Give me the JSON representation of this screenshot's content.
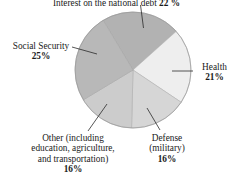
{
  "chart_data": {
    "type": "pie",
    "title": "",
    "categories": [
      "Interest on the national debt",
      "Health",
      "Defense (military)",
      "Other (including education, agriculture, and transportation)",
      "Social Security"
    ],
    "values": [
      22,
      21,
      16,
      16,
      25
    ],
    "value_suffix": "%",
    "legend": "none",
    "labels_position": "outside-with-leader-lines",
    "grid": false,
    "slice_colors": [
      "#b2b2b2",
      "#eeeeee",
      "#d6d6d6",
      "#cccccc",
      "#b8b8b8"
    ],
    "outline_color": "#9a9a9a",
    "slices": [
      {
        "name": "interest-on-the-national-debt",
        "label": "Interest on the national debt",
        "value": 22,
        "value_text": "22",
        "percent_text": "22 %",
        "color": "#b2b2b2",
        "start_angle_deg": -31,
        "end_angle_deg": 48
      },
      {
        "name": "health",
        "label": "Health",
        "value": 21,
        "value_text": "21",
        "percent_text": "21%",
        "color": "#eeeeee",
        "start_angle_deg": 48,
        "end_angle_deg": 124
      },
      {
        "name": "defense-military",
        "label_line_1": "Defense",
        "label_line_2": "(military)",
        "label": "Defense (military)",
        "value": 16,
        "value_text": "16",
        "percent_text": "16%",
        "color": "#d6d6d6",
        "start_angle_deg": 124,
        "end_angle_deg": 182
      },
      {
        "name": "other",
        "label_line_1": "Other (including",
        "label_line_2": "education, agriculture,",
        "label_line_3": "and transportation)",
        "label": "Other (including education, agriculture, and transportation)",
        "value": 16,
        "value_text": "16",
        "percent_text": "16%",
        "color": "#cccccc",
        "start_angle_deg": 182,
        "end_angle_deg": 240
      },
      {
        "name": "social-security",
        "label": "Social Security",
        "value": 25,
        "value_text": "25",
        "percent_text": "25%",
        "color": "#b8b8b8",
        "start_angle_deg": 240,
        "end_angle_deg": 329
      }
    ]
  },
  "labels": {
    "interest": {
      "text": "Interest on the national debt",
      "percent": "22 %"
    },
    "social_security": {
      "text": "Social Security",
      "percent": "25%"
    },
    "health": {
      "text": "Health",
      "percent": "21%"
    },
    "defense": {
      "line1": "Defense",
      "line2": "(military)",
      "percent": "16%"
    },
    "other": {
      "line1": "Other (including",
      "line2": "education, agriculture,",
      "line3": "and transportation)",
      "percent": "16%"
    }
  }
}
